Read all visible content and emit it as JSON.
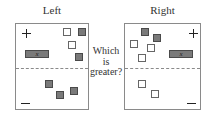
{
  "left_panel": {
    "title": "Left",
    "plus_sign": "+",
    "minus_sign": "−",
    "x_tile_label": "x",
    "positive_region": {
      "x_tiles": [
        {
          "x": 9,
          "y": 26
        }
      ],
      "unit_tiles": [
        {
          "type": "positive",
          "x": 47,
          "y": 4
        },
        {
          "type": "negative",
          "x": 62,
          "y": 4
        },
        {
          "type": "positive",
          "x": 52,
          "y": 17
        },
        {
          "type": "negative",
          "x": 59,
          "y": 29
        }
      ]
    },
    "negative_region": {
      "unit_tiles": [
        {
          "type": "negative",
          "x": 29,
          "y": 56
        },
        {
          "type": "negative",
          "x": 40,
          "y": 67
        },
        {
          "type": "negative",
          "x": 54,
          "y": 63
        }
      ]
    }
  },
  "right_panel": {
    "title": "Right",
    "plus_sign": "+",
    "minus_sign": "−",
    "x_tile_label": "x",
    "positive_region": {
      "x_tiles": [
        {
          "x": 44,
          "y": 26
        }
      ],
      "unit_tiles": [
        {
          "type": "negative",
          "x": 16,
          "y": 4
        },
        {
          "type": "negative",
          "x": 28,
          "y": 10
        },
        {
          "type": "positive",
          "x": 5,
          "y": 16
        },
        {
          "type": "positive",
          "x": 22,
          "y": 20
        },
        {
          "type": "positive",
          "x": 13,
          "y": 30
        }
      ]
    },
    "negative_region": {
      "unit_tiles": [
        {
          "type": "positive",
          "x": 13,
          "y": 56
        },
        {
          "type": "positive",
          "x": 26,
          "y": 66
        }
      ]
    }
  },
  "question": {
    "line1": "Which",
    "line2": "is",
    "line3": "greater?"
  },
  "colors": {
    "negative_tile": "#7a7a7a",
    "positive_tile": "#ffffff",
    "border": "#8a8a8a"
  }
}
